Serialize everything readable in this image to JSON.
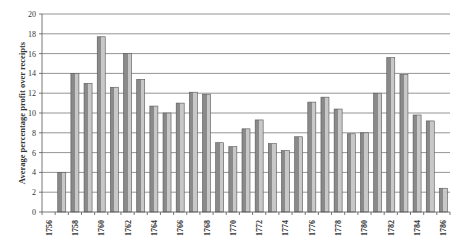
{
  "chart_data": {
    "type": "bar",
    "title": "",
    "xlabel": "",
    "ylabel": "Average percentage profit over receipts",
    "ylim": [
      0,
      20
    ],
    "yticks": [
      0,
      2,
      4,
      6,
      8,
      10,
      12,
      14,
      16,
      18,
      20
    ],
    "grid": true,
    "legend": null,
    "categories": [
      "1756",
      "1757",
      "1758",
      "1759",
      "1760",
      "1761",
      "1762",
      "1763",
      "1764",
      "1765",
      "1766",
      "1767",
      "1768",
      "1769",
      "1770",
      "1771",
      "1772",
      "1773",
      "1774",
      "1775",
      "1776",
      "1777",
      "1778",
      "1779",
      "1780",
      "1781",
      "1782",
      "1783",
      "1784",
      "1785",
      "1786"
    ],
    "xtick_labels": [
      "1756",
      "1758",
      "1760",
      "1762",
      "1764",
      "1766",
      "1768",
      "1770",
      "1772",
      "1774",
      "1776",
      "1778",
      "1780",
      "1782",
      "1784",
      "1786"
    ],
    "values": [
      0,
      4.0,
      14.0,
      13.0,
      17.7,
      12.6,
      16.0,
      13.4,
      10.7,
      10.0,
      11.0,
      12.1,
      11.9,
      7.0,
      6.6,
      8.4,
      9.3,
      6.9,
      6.2,
      7.6,
      11.1,
      11.6,
      10.4,
      7.9,
      8.0,
      12.0,
      15.6,
      13.9,
      9.8,
      9.2,
      2.4
    ],
    "colors": {
      "bar_dark": "#8a8a8a",
      "bar_light": "#c8c8c8",
      "bar_outline": "#555555",
      "grid": "#7a7a7a",
      "axis": "#555555",
      "text": "#333333"
    }
  }
}
